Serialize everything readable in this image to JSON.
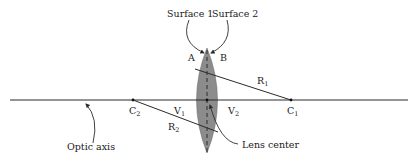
{
  "figure": {
    "type": "biconvex-lens-diagram",
    "colors": {
      "background": "#ffffff",
      "line": "#2b2b2b",
      "lens_fill": "#8c8c8c",
      "text": "#1a1a1a"
    }
  },
  "labels": {
    "surface1": "Surface 1",
    "surface2": "Surface 2",
    "point_a": "A",
    "point_b": "B",
    "r1_main": "R",
    "r1_sub": "1",
    "r2_main": "R",
    "r2_sub": "2",
    "c1_main": "C",
    "c1_sub": "1",
    "c2_main": "C",
    "c2_sub": "2",
    "v1_main": "V",
    "v1_sub": "1",
    "v2_main": "V",
    "v2_sub": "2",
    "optic_axis": "Optic axis",
    "lens_center": "Lens center"
  },
  "geometry": {
    "axis_y": 100,
    "axis_x_start": 10,
    "axis_x_end": 408,
    "lens_center_x": 207,
    "lens_top_y": 48,
    "lens_bottom_y": 153,
    "c1_x": 291,
    "c2_x": 133
  }
}
